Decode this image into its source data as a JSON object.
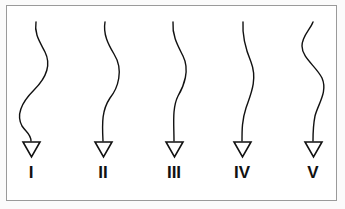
{
  "diagram": {
    "items": [
      {
        "label": "I",
        "curve": "M36,22 C34,34 40,42 45,52 C52,66 44,80 34,90 C22,102 16,115 22,126 C26,132 31,134 31,141",
        "tri_cx": 31
      },
      {
        "label": "II",
        "curve": "M105,22 C103,34 108,44 114,54 C124,70 118,88 110,98 C102,110 102,122 103,141",
        "tri_cx": 103
      },
      {
        "label": "III",
        "curve": "M173,22 C172,36 178,46 183,56 C190,70 184,86 178,96 C172,108 174,124 174,141",
        "tri_cx": 174
      },
      {
        "label": "IV",
        "curve": "M243,22 C242,38 246,50 251,62 C258,80 250,96 246,108 C242,120 242,130 242,141",
        "tri_cx": 242
      },
      {
        "label": "V",
        "curve": "M313,22 C310,30 302,36 302,46 C302,58 316,66 322,78 C328,92 318,104 315,116 C313,126 313,134 313,141",
        "tri_cx": 313
      }
    ]
  }
}
